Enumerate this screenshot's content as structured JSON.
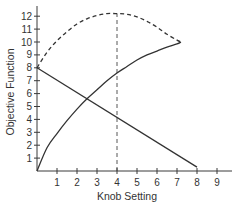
{
  "chart_data": {
    "type": "line",
    "title": "",
    "xlabel": "Knob Setting",
    "ylabel": "Objective Function",
    "xlim": [
      0,
      9.7
    ],
    "ylim": [
      0,
      12.5
    ],
    "xticks": [
      1,
      2,
      3,
      4,
      5,
      6,
      7,
      8,
      9
    ],
    "yticks": [
      1,
      2,
      3,
      4,
      5,
      6,
      7,
      8,
      9,
      10,
      11,
      12
    ],
    "grid": false,
    "legend": "none",
    "series": [
      {
        "name": "increasing-concave",
        "style": "solid",
        "x": [
          0,
          0.5,
          1,
          1.5,
          2,
          2.5,
          3,
          3.5,
          4,
          4.5,
          5,
          5.5,
          6,
          6.5,
          7,
          7.2
        ],
        "y": [
          0,
          1.8,
          2.9,
          3.9,
          4.8,
          5.6,
          6.3,
          7.0,
          7.6,
          8.1,
          8.6,
          9.0,
          9.3,
          9.6,
          9.85,
          10.0
        ]
      },
      {
        "name": "decreasing-linear",
        "style": "solid",
        "x": [
          0,
          8
        ],
        "y": [
          8,
          0.3
        ]
      },
      {
        "name": "sum",
        "style": "dashed",
        "x": [
          0,
          0.5,
          1,
          1.5,
          2,
          2.5,
          3,
          3.5,
          4,
          4.5,
          5,
          5.5,
          6,
          6.5,
          7,
          7.2
        ],
        "y": [
          8.0,
          9.2,
          10.1,
          10.8,
          11.4,
          11.8,
          12.05,
          12.2,
          12.2,
          12.15,
          11.95,
          11.6,
          11.15,
          10.6,
          10.15,
          10.0
        ]
      }
    ],
    "annotations": [
      {
        "type": "vertical-dashed-line",
        "x": 4,
        "y_from": 0,
        "y_to": 12.2,
        "label": "optimum"
      }
    ]
  }
}
